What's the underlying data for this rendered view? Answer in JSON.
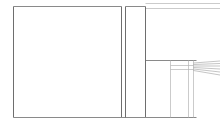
{
  "document": {
    "title": "Line Drawing",
    "description": "Faint grayscale technical line drawing of an architectural elevation",
    "background_color": "#ffffff",
    "line_color": "#8a8a8a",
    "line_color_dark": "#6e6e6e",
    "line_color_faint": "#b4b4b4",
    "width": 220,
    "height": 128
  },
  "drawing": {
    "type": "line-art",
    "stroke_widths": {
      "main": 1.0,
      "thin": 0.7,
      "hairline": 0.5
    },
    "shapes": {
      "main_panel": {
        "name": "large-blank-panel",
        "x": 13.5,
        "y": 6.5,
        "width": 108,
        "height": 111
      },
      "mid_panel": {
        "name": "narrow-vertical-panel",
        "x": 125.5,
        "y": 6.5,
        "width": 20,
        "height": 111
      }
    },
    "horizontal_lines": [
      {
        "name": "outer-top-edge",
        "x1": 13.5,
        "y1": 6.5,
        "x2": 121.5,
        "y2": 6.5
      },
      {
        "name": "outer-bottom-edge",
        "x1": 13.5,
        "y1": 117.5,
        "x2": 121.5,
        "y2": 117.5
      },
      {
        "name": "mid-panel-top",
        "x1": 125.5,
        "y1": 6.5,
        "x2": 145.5,
        "y2": 6.5
      },
      {
        "name": "mid-panel-bottom",
        "x1": 121.5,
        "y1": 117.5,
        "x2": 145.5,
        "y2": 117.5
      },
      {
        "name": "upper-roof-line-outer",
        "x1": 145.5,
        "y1": 3.5,
        "x2": 220,
        "y2": 3.5
      },
      {
        "name": "upper-roof-line-inner",
        "x1": 145.5,
        "y1": 8.5,
        "x2": 220,
        "y2": 8.5
      },
      {
        "name": "mid-shelf-line",
        "x1": 145.5,
        "y1": 60.5,
        "x2": 196.5,
        "y2": 60.5
      },
      {
        "name": "rail-line-upper",
        "x1": 170.5,
        "y1": 65.5,
        "x2": 193.5,
        "y2": 65.5
      },
      {
        "name": "rail-line-lower",
        "x1": 170.5,
        "y1": 69.5,
        "x2": 193.5,
        "y2": 69.5
      },
      {
        "name": "lower-base-line",
        "x1": 145.5,
        "y1": 117.5,
        "x2": 196.5,
        "y2": 117.5
      }
    ],
    "vertical_lines": [
      {
        "name": "panel-left-edge",
        "x1": 13.5,
        "y1": 6.5,
        "x2": 13.5,
        "y2": 117.5
      },
      {
        "name": "panel-right-edge",
        "x1": 121.5,
        "y1": 6.5,
        "x2": 121.5,
        "y2": 117.5
      },
      {
        "name": "mid-panel-left-edge",
        "x1": 125.5,
        "y1": 6.5,
        "x2": 125.5,
        "y2": 117.5
      },
      {
        "name": "mid-panel-right-edge",
        "x1": 145.5,
        "y1": 6.5,
        "x2": 145.5,
        "y2": 117.5
      },
      {
        "name": "bay-divider-left",
        "x1": 170.5,
        "y1": 60.5,
        "x2": 170.5,
        "y2": 117.5
      },
      {
        "name": "bay-divider-mid",
        "x1": 188.5,
        "y1": 60.5,
        "x2": 188.5,
        "y2": 117.5
      },
      {
        "name": "bay-divider-right",
        "x1": 193.5,
        "y1": 60.5,
        "x2": 193.5,
        "y2": 117.5
      }
    ],
    "converging_lines": {
      "name": "perspective-ray-bundle",
      "origin_x": 193.5,
      "rays": [
        {
          "x1": 193.5,
          "y1": 63.0,
          "x2": 220,
          "y2": 61.0
        },
        {
          "x1": 193.5,
          "y1": 64.5,
          "x2": 220,
          "y2": 63.5
        },
        {
          "x1": 193.5,
          "y1": 66.0,
          "x2": 220,
          "y2": 66.0
        },
        {
          "x1": 193.5,
          "y1": 67.5,
          "x2": 220,
          "y2": 69.0
        },
        {
          "x1": 193.5,
          "y1": 69.0,
          "x2": 220,
          "y2": 72.0
        },
        {
          "x1": 193.5,
          "y1": 70.5,
          "x2": 220,
          "y2": 75.0
        }
      ]
    }
  }
}
